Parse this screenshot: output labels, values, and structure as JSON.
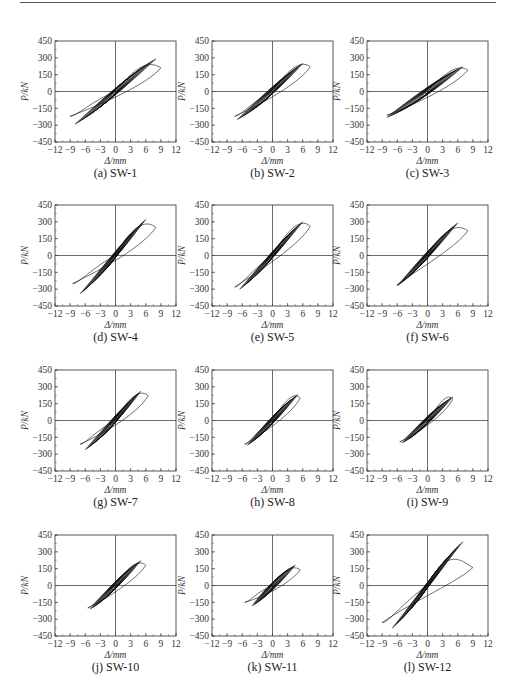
{
  "figure": {
    "axes": {
      "xlabel": "Δ/mm",
      "ylabel": "P/kN",
      "xlim": [
        -12,
        12
      ],
      "ylim": [
        -450,
        450
      ],
      "xticks": [
        "-12",
        "-9",
        "-6",
        "-3",
        "0",
        "3",
        "6",
        "9",
        "12"
      ],
      "yticks": [
        "450",
        "300",
        "150",
        "0",
        "-150",
        "-300",
        "-450"
      ]
    },
    "panels": [
      {
        "id": "a",
        "caption": "(a) SW-1"
      },
      {
        "id": "b",
        "caption": "(b) SW-2"
      },
      {
        "id": "c",
        "caption": "(c) SW-3"
      },
      {
        "id": "d",
        "caption": "(d) SW-4"
      },
      {
        "id": "e",
        "caption": "(e) SW-5"
      },
      {
        "id": "f",
        "caption": "(f) SW-6"
      },
      {
        "id": "g",
        "caption": "(g) SW-7"
      },
      {
        "id": "h",
        "caption": "(h) SW-8"
      },
      {
        "id": "i",
        "caption": "(i) SW-9"
      },
      {
        "id": "j",
        "caption": "(j) SW-10"
      },
      {
        "id": "k",
        "caption": "(k) SW-11"
      },
      {
        "id": "l",
        "caption": "(l) SW-12"
      }
    ]
  },
  "chart_data": [
    {
      "type": "line",
      "title": "(a) SW-1",
      "xlabel": "Δ/mm",
      "ylabel": "P/kN",
      "xlim": [
        -12,
        12
      ],
      "ylim": [
        -450,
        450
      ],
      "grid": false,
      "legend": "none",
      "series": [
        {
          "name": "hysteresis",
          "peak_pos": {
            "x": 8,
            "y": 290
          },
          "peak_neg": {
            "x": -8,
            "y": -290
          },
          "last_loop_pos": {
            "x": 9,
            "y": 210
          },
          "last_loop_neg": {
            "x": -9,
            "y": -220
          }
        }
      ]
    },
    {
      "type": "line",
      "title": "(b) SW-2",
      "xlabel": "Δ/mm",
      "ylabel": "P/kN",
      "xlim": [
        -12,
        12
      ],
      "ylim": [
        -450,
        450
      ],
      "grid": false,
      "legend": "none",
      "series": [
        {
          "name": "hysteresis",
          "peak_pos": {
            "x": 6,
            "y": 250
          },
          "peak_neg": {
            "x": -7,
            "y": -250
          },
          "last_loop_pos": {
            "x": 7.5,
            "y": 220
          },
          "last_loop_neg": {
            "x": -7.5,
            "y": -220
          }
        }
      ]
    },
    {
      "type": "line",
      "title": "(c) SW-3",
      "xlabel": "Δ/mm",
      "ylabel": "P/kN",
      "xlim": [
        -12,
        12
      ],
      "ylim": [
        -450,
        450
      ],
      "grid": false,
      "legend": "none",
      "series": [
        {
          "name": "hysteresis",
          "peak_pos": {
            "x": 7,
            "y": 220
          },
          "peak_neg": {
            "x": -8,
            "y": -230
          },
          "last_loop_pos": {
            "x": 8,
            "y": 190
          },
          "last_loop_neg": {
            "x": -8,
            "y": -210
          }
        }
      ]
    },
    {
      "type": "line",
      "title": "(d) SW-4",
      "xlabel": "Δ/mm",
      "ylabel": "P/kN",
      "xlim": [
        -12,
        12
      ],
      "ylim": [
        -450,
        450
      ],
      "grid": false,
      "legend": "none",
      "series": [
        {
          "name": "hysteresis",
          "peak_pos": {
            "x": 6,
            "y": 320
          },
          "peak_neg": {
            "x": -7,
            "y": -340
          },
          "last_loop_pos": {
            "x": 8,
            "y": 250
          },
          "last_loop_neg": {
            "x": -8.5,
            "y": -250
          }
        }
      ]
    },
    {
      "type": "line",
      "title": "(e) SW-5",
      "xlabel": "Δ/mm",
      "ylabel": "P/kN",
      "xlim": [
        -12,
        12
      ],
      "ylim": [
        -450,
        450
      ],
      "grid": false,
      "legend": "none",
      "series": [
        {
          "name": "hysteresis",
          "peak_pos": {
            "x": 6,
            "y": 300
          },
          "peak_neg": {
            "x": -6.5,
            "y": -300
          },
          "last_loop_pos": {
            "x": 7.5,
            "y": 260
          },
          "last_loop_neg": {
            "x": -7.5,
            "y": -280
          }
        }
      ]
    },
    {
      "type": "line",
      "title": "(f) SW-6",
      "xlabel": "Δ/mm",
      "ylabel": "P/kN",
      "xlim": [
        -12,
        12
      ],
      "ylim": [
        -450,
        450
      ],
      "grid": false,
      "legend": "none",
      "series": [
        {
          "name": "hysteresis",
          "peak_pos": {
            "x": 6,
            "y": 290
          },
          "peak_neg": {
            "x": -6,
            "y": -270
          },
          "last_loop_pos": {
            "x": 8,
            "y": 220
          },
          "last_loop_neg": {
            "x": -6,
            "y": -260
          }
        }
      ]
    },
    {
      "type": "line",
      "title": "(g) SW-7",
      "xlabel": "Δ/mm",
      "ylabel": "P/kN",
      "xlim": [
        -12,
        12
      ],
      "ylim": [
        -450,
        450
      ],
      "grid": false,
      "legend": "none",
      "series": [
        {
          "name": "hysteresis",
          "peak_pos": {
            "x": 5,
            "y": 260
          },
          "peak_neg": {
            "x": -6,
            "y": -260
          },
          "last_loop_pos": {
            "x": 6.5,
            "y": 220
          },
          "last_loop_neg": {
            "x": -7,
            "y": -210
          }
        }
      ]
    },
    {
      "type": "line",
      "title": "(h) SW-8",
      "xlabel": "Δ/mm",
      "ylabel": "P/kN",
      "xlim": [
        -12,
        12
      ],
      "ylim": [
        -450,
        450
      ],
      "grid": false,
      "legend": "none",
      "series": [
        {
          "name": "hysteresis",
          "peak_pos": {
            "x": 5,
            "y": 230
          },
          "peak_neg": {
            "x": -5,
            "y": -220
          },
          "last_loop_pos": {
            "x": 5.5,
            "y": 200
          },
          "last_loop_neg": {
            "x": -5.5,
            "y": -210
          }
        }
      ]
    },
    {
      "type": "line",
      "title": "(i) SW-9",
      "xlabel": "Δ/mm",
      "ylabel": "P/kN",
      "xlim": [
        -12,
        12
      ],
      "ylim": [
        -450,
        450
      ],
      "grid": false,
      "legend": "none",
      "series": [
        {
          "name": "hysteresis",
          "peak_pos": {
            "x": 5,
            "y": 210
          },
          "peak_neg": {
            "x": -5,
            "y": -200
          },
          "last_loop_pos": {
            "x": 5,
            "y": 190
          },
          "last_loop_neg": {
            "x": -5.5,
            "y": -190
          }
        }
      ]
    },
    {
      "type": "line",
      "title": "(j) SW-10",
      "xlabel": "Δ/mm",
      "ylabel": "P/kN",
      "xlim": [
        -12,
        12
      ],
      "ylim": [
        -450,
        450
      ],
      "grid": false,
      "legend": "none",
      "series": [
        {
          "name": "hysteresis",
          "peak_pos": {
            "x": 5,
            "y": 220
          },
          "peak_neg": {
            "x": -5,
            "y": -210
          },
          "last_loop_pos": {
            "x": 6,
            "y": 180
          },
          "last_loop_neg": {
            "x": -5.5,
            "y": -200
          }
        }
      ]
    },
    {
      "type": "line",
      "title": "(k) SW-11",
      "xlabel": "Δ/mm",
      "ylabel": "P/kN",
      "xlim": [
        -12,
        12
      ],
      "ylim": [
        -450,
        450
      ],
      "grid": false,
      "legend": "none",
      "series": [
        {
          "name": "hysteresis",
          "peak_pos": {
            "x": 4.5,
            "y": 180
          },
          "peak_neg": {
            "x": -4,
            "y": -180
          },
          "last_loop_pos": {
            "x": 5.5,
            "y": 140
          },
          "last_loop_neg": {
            "x": -5.5,
            "y": -150
          }
        }
      ]
    },
    {
      "type": "line",
      "title": "(l) SW-12",
      "xlabel": "Δ/mm",
      "ylabel": "P/kN",
      "xlim": [
        -12,
        12
      ],
      "ylim": [
        -450,
        450
      ],
      "grid": false,
      "legend": "none",
      "series": [
        {
          "name": "hysteresis",
          "peak_pos": {
            "x": 7,
            "y": 390
          },
          "peak_neg": {
            "x": -7,
            "y": -380
          },
          "last_loop_pos": {
            "x": 9,
            "y": 160
          },
          "last_loop_neg": {
            "x": -9,
            "y": -330
          }
        }
      ]
    }
  ]
}
